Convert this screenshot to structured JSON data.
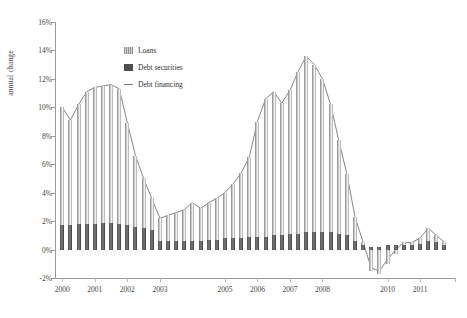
{
  "chart_data": {
    "type": "bar",
    "title": "",
    "subtitle": "",
    "xlabel": "",
    "ylabel": "annual change",
    "ylim": [
      -2,
      16
    ],
    "ytick_labels": [
      "16%",
      "14%",
      "12%",
      "10%",
      "8%",
      "6%",
      "4%",
      "2%",
      "0%",
      "-2%"
    ],
    "ytick_values": [
      16,
      14,
      12,
      10,
      8,
      6,
      4,
      2,
      0,
      -2
    ],
    "xtick_labels": [
      "2000",
      "2001",
      "2002",
      "2003",
      "2005",
      "2006",
      "2007",
      "2008",
      "2010",
      "2011"
    ],
    "xtick_years": [
      2000,
      2001,
      2002,
      2003,
      2005,
      2006,
      2007,
      2008,
      2010,
      2011
    ],
    "grid": false,
    "legend_position": "upper-center",
    "stacked": true,
    "x": [
      "2000Q1",
      "2000Q2",
      "2000Q3",
      "2000Q4",
      "2001Q1",
      "2001Q2",
      "2001Q3",
      "2001Q4",
      "2002Q1",
      "2002Q2",
      "2002Q3",
      "2002Q4",
      "2003Q1",
      "2003Q2",
      "2003Q3",
      "2003Q4",
      "2004Q1",
      "2004Q2",
      "2004Q3",
      "2004Q4",
      "2005Q1",
      "2005Q2",
      "2005Q3",
      "2005Q4",
      "2006Q1",
      "2006Q2",
      "2006Q3",
      "2006Q4",
      "2007Q1",
      "2007Q2",
      "2007Q3",
      "2007Q4",
      "2008Q1",
      "2008Q2",
      "2008Q3",
      "2008Q4",
      "2009Q1",
      "2009Q2",
      "2009Q3",
      "2009Q4",
      "2010Q1",
      "2010Q2",
      "2010Q3",
      "2010Q4",
      "2011Q1",
      "2011Q2",
      "2011Q3",
      "2011Q4"
    ],
    "series": [
      {
        "name": "Debt securities",
        "color": "#4f4f4f",
        "values": [
          1.7,
          1.7,
          1.8,
          1.8,
          1.8,
          1.9,
          1.9,
          1.8,
          1.7,
          1.6,
          1.5,
          1.4,
          0.6,
          0.6,
          0.6,
          0.6,
          0.6,
          0.6,
          0.7,
          0.7,
          0.8,
          0.8,
          0.8,
          0.9,
          0.9,
          0.9,
          1.0,
          1.0,
          1.1,
          1.1,
          1.2,
          1.2,
          1.2,
          1.2,
          1.1,
          1.0,
          0.6,
          0.3,
          0.2,
          0.2,
          0.3,
          0.3,
          0.3,
          0.3,
          0.4,
          0.6,
          0.5,
          0.3
        ]
      },
      {
        "name": "Loans",
        "color": "#9a9a9a",
        "values": [
          8.3,
          7.4,
          8.4,
          9.3,
          9.6,
          9.6,
          9.7,
          9.5,
          7.2,
          5.0,
          3.5,
          2.2,
          1.6,
          1.8,
          2.0,
          2.2,
          2.7,
          2.3,
          2.6,
          2.9,
          3.2,
          3.8,
          4.6,
          5.6,
          8.1,
          9.7,
          10.1,
          9.3,
          10.1,
          11.4,
          12.4,
          11.8,
          10.8,
          9.0,
          6.6,
          4.3,
          1.7,
          0.2,
          -1.5,
          -1.7,
          -1.0,
          -0.3,
          0.2,
          0.2,
          0.4,
          0.9,
          0.5,
          0.2
        ]
      }
    ],
    "line": {
      "name": "Debt financing",
      "color": "#777777",
      "values": [
        10.0,
        9.1,
        10.2,
        11.1,
        11.4,
        11.5,
        11.6,
        11.3,
        8.9,
        6.6,
        5.0,
        3.6,
        2.2,
        2.4,
        2.6,
        2.8,
        3.3,
        2.9,
        3.3,
        3.6,
        4.0,
        4.6,
        5.4,
        6.5,
        9.0,
        10.6,
        11.1,
        10.3,
        11.2,
        12.5,
        13.6,
        13.0,
        12.0,
        10.2,
        7.7,
        5.3,
        2.3,
        0.5,
        -1.3,
        -1.5,
        -0.7,
        0.0,
        0.5,
        0.5,
        0.8,
        1.5,
        1.0,
        0.5
      ]
    }
  },
  "legend": {
    "items": [
      {
        "label": "Loans",
        "type": "swatch-hatched"
      },
      {
        "label": "Debt securities",
        "type": "swatch-solid"
      },
      {
        "label": "Debt financing",
        "type": "line"
      }
    ]
  },
  "axis": {
    "y_title": "annual change"
  }
}
